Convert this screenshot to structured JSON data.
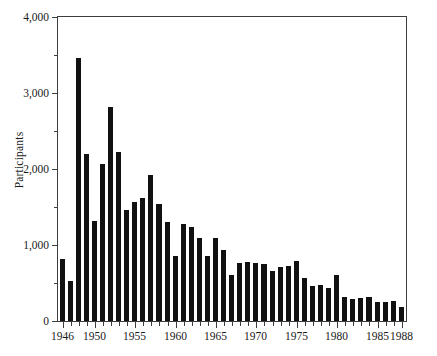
{
  "chart_data": {
    "type": "bar",
    "title": "",
    "subtitle": "",
    "xlabel": "",
    "ylabel": "Participants",
    "ylim": [
      0,
      4000
    ],
    "xlim": [
      1946,
      1988
    ],
    "grid": false,
    "legend": null,
    "bar_color": "#111111",
    "axis_color": "#3d3d3d",
    "y_ticks_major": [
      0,
      1000,
      2000,
      3000,
      4000
    ],
    "y_ticks_major_labels": [
      "0",
      "1,000",
      "2,000",
      "3,000",
      "4,000"
    ],
    "y_ticks_minor": [
      500,
      1500,
      2500,
      3500
    ],
    "x_tick_labels": [
      "1946",
      "1950",
      "1955",
      "1960",
      "1965",
      "1970",
      "1975",
      "1980",
      "1985",
      "1988"
    ],
    "x_labelled_years": [
      1946,
      1950,
      1955,
      1960,
      1965,
      1970,
      1975,
      1980,
      1985,
      1988
    ],
    "categories": [
      1946,
      1947,
      1948,
      1949,
      1950,
      1951,
      1952,
      1953,
      1954,
      1955,
      1956,
      1957,
      1958,
      1959,
      1960,
      1961,
      1962,
      1963,
      1964,
      1965,
      1966,
      1967,
      1968,
      1969,
      1970,
      1971,
      1972,
      1973,
      1974,
      1975,
      1976,
      1977,
      1978,
      1979,
      1980,
      1981,
      1982,
      1983,
      1984,
      1985,
      1986,
      1987,
      1988
    ],
    "values": [
      820,
      520,
      3460,
      2200,
      1320,
      2060,
      2820,
      2230,
      1460,
      1560,
      1620,
      1920,
      1540,
      1300,
      850,
      1280,
      1240,
      1090,
      850,
      1090,
      940,
      600,
      760,
      770,
      760,
      750,
      660,
      710,
      730,
      790,
      560,
      460,
      480,
      440,
      600,
      310,
      290,
      300,
      320,
      250,
      250,
      260,
      190
    ]
  }
}
